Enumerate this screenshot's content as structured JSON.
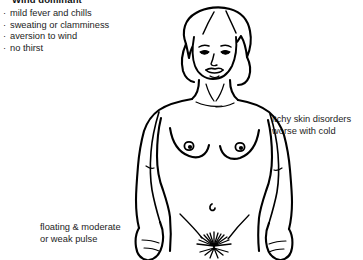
{
  "diagram": {
    "title": "Wind dominant",
    "symptoms": [
      "mild fever and chills",
      "sweating or clamminess",
      "aversion to wind",
      "no thirst"
    ],
    "bullet_char": "·",
    "annotations": {
      "skin": "itchy skin disorders\nworse with cold",
      "skin_line1": "itchy skin disorders",
      "skin_line2": "worse with cold",
      "pulse": "floating & moderate\nor weak pulse",
      "pulse_line1": "floating & moderate",
      "pulse_line2": "or weak pulse"
    },
    "figure": {
      "description": "front-facing nude female body line drawing",
      "line_color": "#000000",
      "fill_color": "#ffffff"
    },
    "colors": {
      "background": "#ffffff",
      "text": "#1d1d1d",
      "title": "#111111",
      "ink": "#000000"
    }
  }
}
